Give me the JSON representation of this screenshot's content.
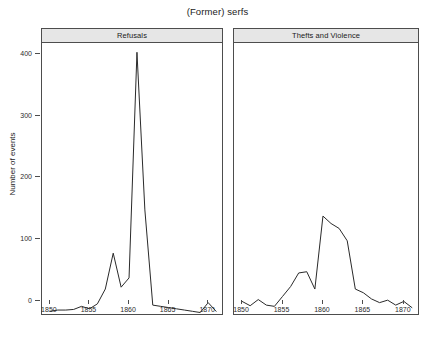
{
  "chart_data": {
    "type": "line",
    "title": "(Former) serfs",
    "xlabel": "",
    "ylabel": "Number of events",
    "grid": false,
    "legend": false,
    "xlim": [
      1849,
      1872
    ],
    "ylim": [
      0,
      440
    ],
    "yticks": [
      0,
      100,
      200,
      300,
      400
    ],
    "xticks": [
      1850,
      1855,
      1860,
      1865,
      1870
    ],
    "panels": [
      {
        "label": "Refusals",
        "x": [
          1850,
          1851,
          1852,
          1853,
          1854,
          1855,
          1856,
          1857,
          1858,
          1859,
          1860,
          1861,
          1862,
          1863,
          1864,
          1865,
          1866,
          1867,
          1868,
          1869,
          1870,
          1871
        ],
        "values": [
          6,
          8,
          8,
          9,
          14,
          10,
          18,
          42,
          100,
          45,
          60,
          425,
          170,
          16,
          14,
          12,
          10,
          8,
          6,
          4,
          20,
          6
        ]
      },
      {
        "label": "Thefts and Violence",
        "x": [
          1850,
          1851,
          1852,
          1853,
          1854,
          1855,
          1856,
          1857,
          1858,
          1859,
          1860,
          1861,
          1862,
          1863,
          1864,
          1865,
          1866,
          1867,
          1868,
          1869,
          1870,
          1871
        ],
        "values": [
          22,
          15,
          25,
          16,
          14,
          30,
          46,
          68,
          70,
          42,
          160,
          148,
          140,
          120,
          42,
          36,
          26,
          20,
          24,
          16,
          22,
          12
        ]
      }
    ]
  },
  "axis": {
    "ytick_labels": [
      "0",
      "100",
      "200",
      "300",
      "400"
    ],
    "xtick_labels": [
      "1850",
      "1855",
      "1860",
      "1865",
      "1870"
    ],
    "ylabel": "Number of events"
  },
  "title": "(Former) serfs",
  "panel_labels": {
    "left": "Refusals",
    "right": "Thefts and Violence"
  },
  "colors": {
    "line": "#2a2a2a",
    "strip_fill": "#e6e6e6",
    "frame": "#4d4d4d",
    "background": "#ffffff"
  }
}
